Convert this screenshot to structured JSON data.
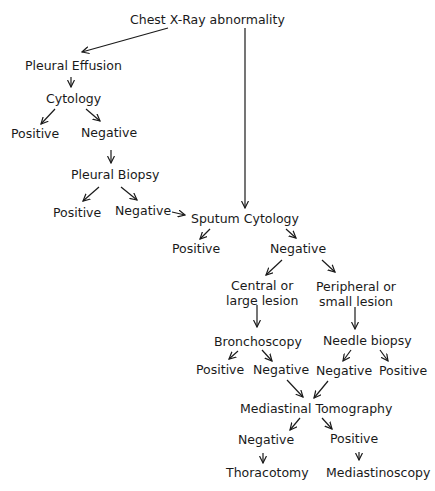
{
  "diagram": {
    "type": "flowchart",
    "nodes": {
      "chest_xray": "Chest X-Ray abnormality",
      "pleural_effusion": "Pleural Effusion",
      "cytology": "Cytology",
      "cytology_positive": "Positive",
      "cytology_negative": "Negative",
      "pleural_biopsy": "Pleural Biopsy",
      "biopsy_positive": "Positive",
      "biopsy_negative": "Negative",
      "sputum_cytology": "Sputum Cytology",
      "sputum_positive": "Positive",
      "sputum_negative": "Negative",
      "central_line1": "Central or",
      "central_line2": "large lesion",
      "peripheral_line1": "Peripheral or",
      "peripheral_line2": "small lesion",
      "bronchoscopy": "Bronchoscopy",
      "bronch_positive": "Positive",
      "bronch_negative": "Negative",
      "needle_biopsy": "Needle biopsy",
      "needle_negative": "Negative",
      "needle_positive": "Positive",
      "mediastinal_tomography": "Mediastinal Tomography",
      "tomo_negative": "Negative",
      "tomo_positive": "Positive",
      "thoracotomy": "Thoracotomy",
      "mediastinoscopy": "Mediastinoscopy"
    },
    "edges": [
      [
        "chest_xray",
        "pleural_effusion"
      ],
      [
        "chest_xray",
        "sputum_cytology"
      ],
      [
        "pleural_effusion",
        "cytology"
      ],
      [
        "cytology",
        "cytology_positive"
      ],
      [
        "cytology",
        "cytology_negative"
      ],
      [
        "cytology_negative",
        "pleural_biopsy"
      ],
      [
        "pleural_biopsy",
        "biopsy_positive"
      ],
      [
        "pleural_biopsy",
        "biopsy_negative"
      ],
      [
        "biopsy_negative",
        "sputum_cytology"
      ],
      [
        "sputum_cytology",
        "sputum_positive"
      ],
      [
        "sputum_cytology",
        "sputum_negative"
      ],
      [
        "sputum_negative",
        "central_lesion"
      ],
      [
        "sputum_negative",
        "peripheral_lesion"
      ],
      [
        "central_lesion",
        "bronchoscopy"
      ],
      [
        "peripheral_lesion",
        "needle_biopsy"
      ],
      [
        "bronchoscopy",
        "bronch_positive"
      ],
      [
        "bronchoscopy",
        "bronch_negative"
      ],
      [
        "needle_biopsy",
        "needle_negative"
      ],
      [
        "needle_biopsy",
        "needle_positive"
      ],
      [
        "bronch_negative",
        "mediastinal_tomography"
      ],
      [
        "needle_negative",
        "mediastinal_tomography"
      ],
      [
        "mediastinal_tomography",
        "tomo_negative"
      ],
      [
        "mediastinal_tomography",
        "tomo_positive"
      ],
      [
        "tomo_negative",
        "thoracotomy"
      ],
      [
        "tomo_positive",
        "mediastinoscopy"
      ]
    ]
  }
}
